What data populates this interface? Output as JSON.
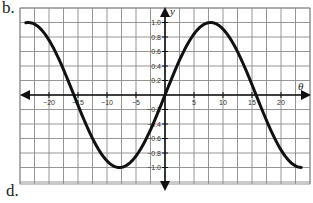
{
  "labels": {
    "part_b": "b.",
    "part_d": "d."
  },
  "chart_data": {
    "type": "line",
    "title": "",
    "xlabel": "θ",
    "ylabel": "y",
    "xlim": [
      -25,
      25
    ],
    "ylim": [
      -1.2,
      1.2
    ],
    "grid": true,
    "x_ticks": [
      -20,
      -15,
      -10,
      -5,
      5,
      10,
      15,
      20
    ],
    "x_tick_labels": [
      "−20",
      "−15",
      "−10",
      "−5",
      "5",
      "10",
      "15",
      "20"
    ],
    "y_ticks": [
      1.0,
      0.8,
      0.6,
      0.4,
      0.2,
      -0.2,
      -0.4,
      -0.6,
      -0.8,
      -1.0
    ],
    "y_tick_labels": [
      "1.0",
      "0.8",
      "0.6",
      "0.4",
      "0.2",
      "−0.2",
      "−0.4",
      "−0.6",
      "−0.8",
      "−1.0"
    ],
    "series": [
      {
        "name": "y = sin(θ/5)",
        "x": [
          -24,
          -20,
          -15.7,
          -12,
          -7.85,
          -4,
          0,
          4,
          7.85,
          12,
          15.7,
          20,
          23.6
        ],
        "values": [
          1.0,
          0.76,
          0.0,
          -0.68,
          -1.0,
          -0.72,
          0.0,
          0.72,
          1.0,
          0.68,
          0.0,
          -0.76,
          -1.0
        ]
      }
    ],
    "line_color": "#111111"
  }
}
